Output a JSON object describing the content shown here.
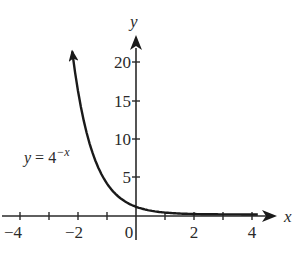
{
  "chart_data": {
    "type": "line",
    "title": "",
    "xlabel": "x",
    "ylabel": "y",
    "xlim": [
      -4.3,
      4.9
    ],
    "ylim": [
      -1.5,
      24
    ],
    "grid": false,
    "legend": null,
    "x_ticks": [
      -4,
      -3,
      -2,
      -1,
      0,
      1,
      2,
      3,
      4
    ],
    "x_tick_labels": [
      "-4",
      "",
      "-2",
      "",
      "0",
      "",
      "2",
      "",
      "4"
    ],
    "y_ticks": [
      5,
      10,
      15,
      20
    ],
    "y_tick_labels": [
      "5",
      "10",
      "15",
      "20"
    ],
    "annotations": [
      {
        "text": "y = 4^{-x}",
        "x": -2.6,
        "y": 7.5
      }
    ],
    "series": [
      {
        "name": "y = 4^(-x)",
        "function": "4^(-x)",
        "x": [
          -2.2,
          -2,
          -1.5,
          -1,
          -0.5,
          0,
          0.5,
          1,
          2,
          3,
          4
        ],
        "values": [
          21.1,
          16,
          8,
          4,
          2,
          1,
          0.5,
          0.25,
          0.0625,
          0.0156,
          0.0039
        ],
        "arrow_end_left": true,
        "arrow_end_right": false
      }
    ]
  },
  "labels": {
    "x_axis": "x",
    "y_axis": "y",
    "x_ticks": [
      "−4",
      "−2",
      "0",
      "2",
      "4"
    ],
    "y_ticks": [
      "5",
      "10",
      "15",
      "20"
    ],
    "equation_prefix": "y = 4",
    "equation_exponent": "−x"
  }
}
